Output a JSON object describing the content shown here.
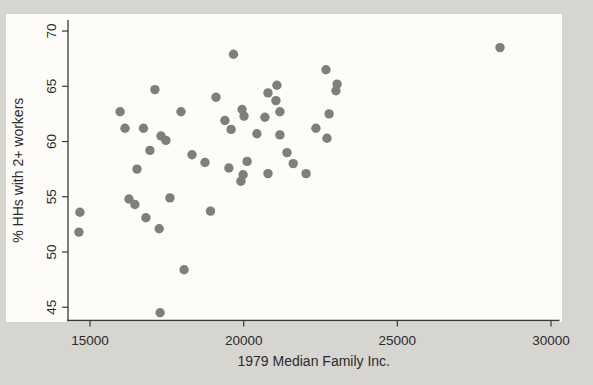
{
  "figure": {
    "page_background": "#d7d5d0",
    "plot_background": "#fdfcf8",
    "axis_color": "#3a3a3a",
    "text_color": "#2b2b2b"
  },
  "chart_data": {
    "type": "scatter",
    "title": "",
    "xlabel": "1979 Median Family Inc.",
    "ylabel": "% HHs with 2+ workers",
    "xlim": [
      14284,
      30276
    ],
    "ylim": [
      43.8,
      71.0
    ],
    "x_ticks": [
      15000,
      20000,
      25000,
      30000
    ],
    "x_tick_labels": [
      "15000",
      "20000",
      "25000",
      "30000"
    ],
    "y_ticks": [
      45,
      50,
      55,
      60,
      65,
      70
    ],
    "y_tick_labels": [
      "45",
      "50",
      "55",
      "60",
      "65",
      "70"
    ],
    "grid": false,
    "legend": null,
    "marker": {
      "shape": "circle",
      "color": "#7e7e7e",
      "radius_px": 4.7
    },
    "points": [
      [
        19670,
        67.9
      ],
      [
        28340,
        68.5
      ],
      [
        22680,
        66.5
      ],
      [
        23040,
        65.2
      ],
      [
        23000,
        64.6
      ],
      [
        17110,
        64.7
      ],
      [
        19100,
        64.0
      ],
      [
        21080,
        65.1
      ],
      [
        20790,
        64.4
      ],
      [
        21050,
        63.7
      ],
      [
        21180,
        62.7
      ],
      [
        15980,
        62.7
      ],
      [
        17960,
        62.7
      ],
      [
        16140,
        61.2
      ],
      [
        16740,
        61.2
      ],
      [
        17310,
        60.5
      ],
      [
        17470,
        60.1
      ],
      [
        19950,
        62.9
      ],
      [
        20010,
        62.3
      ],
      [
        19390,
        61.9
      ],
      [
        19590,
        61.1
      ],
      [
        20690,
        62.2
      ],
      [
        22780,
        62.5
      ],
      [
        22350,
        61.2
      ],
      [
        22710,
        60.3
      ],
      [
        20430,
        60.7
      ],
      [
        21180,
        60.6
      ],
      [
        16950,
        59.2
      ],
      [
        18320,
        58.8
      ],
      [
        18740,
        58.1
      ],
      [
        16530,
        57.5
      ],
      [
        19520,
        57.6
      ],
      [
        20110,
        58.2
      ],
      [
        19980,
        57.0
      ],
      [
        19910,
        56.4
      ],
      [
        20790,
        57.1
      ],
      [
        21410,
        59.0
      ],
      [
        21610,
        58.0
      ],
      [
        22030,
        57.1
      ],
      [
        14670,
        53.6
      ],
      [
        14640,
        51.8
      ],
      [
        16270,
        54.8
      ],
      [
        16460,
        54.3
      ],
      [
        16820,
        53.1
      ],
      [
        17600,
        54.9
      ],
      [
        17250,
        52.1
      ],
      [
        18920,
        53.7
      ],
      [
        18060,
        48.4
      ],
      [
        17280,
        44.5
      ]
    ]
  }
}
